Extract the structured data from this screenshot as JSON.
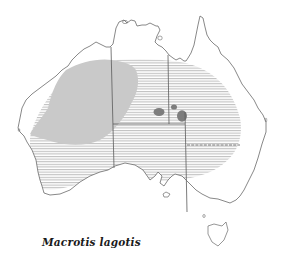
{
  "map": {
    "title": "Macrotis lagotis",
    "region": "Australia",
    "colors": {
      "background": "#ffffff",
      "coastline": "#6a6a6a",
      "borders": "#5a5a5a",
      "historical_range_hatch": "#b9b9b9",
      "current_range_fill": "#c9c9c9",
      "core_population_fill": "#7d7d7d"
    },
    "legend_layers": [
      {
        "name": "historical-range",
        "style": "horizontal hatching"
      },
      {
        "name": "current-range",
        "style": "solid light grey"
      },
      {
        "name": "core-populations",
        "style": "solid dark grey"
      }
    ]
  }
}
